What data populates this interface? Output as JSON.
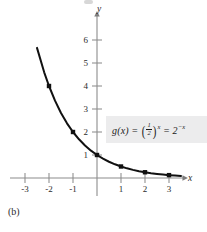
{
  "figure": {
    "caption": "(b)",
    "background_color": "#ffffff",
    "curve_color": "#111111",
    "axis_color": "#8c8c8c",
    "formula_box_color": "#ececed"
  },
  "axes": {
    "x_label": "x",
    "y_label": "y",
    "x_ticks": [
      "-3",
      "-2",
      "-1",
      "1",
      "2",
      "3"
    ],
    "x_tick_values": [
      -3,
      -2,
      -1,
      1,
      2,
      3
    ],
    "y_ticks": [
      "1",
      "2",
      "3",
      "4",
      "5",
      "6"
    ],
    "y_tick_values": [
      1,
      2,
      3,
      4,
      5,
      6
    ],
    "origin_label": ""
  },
  "formula": {
    "function_name": "g(x)",
    "equals_1": "=",
    "base_numerator": "1",
    "base_denominator": "2",
    "exponent_1": "x",
    "equals_2": "=",
    "base_2": "2",
    "exponent_2": "−x",
    "plain_text": "g(x) = (1/2)^x = 2^(-x)"
  },
  "chart_data": {
    "type": "line",
    "title": "",
    "subtitle": "",
    "xlabel": "x",
    "ylabel": "y",
    "xlim": [
      -3.6,
      3.9
    ],
    "ylim": [
      -0.35,
      7.0
    ],
    "grid": false,
    "legend": null,
    "annotations": [
      {
        "text": "g(x) = (1/2)^x = 2^(-x)",
        "x": 1.1,
        "y": 2.0
      }
    ],
    "series": [
      {
        "name": "g(x) = (1/2)^x = 2^-x",
        "x": [
          -3.1,
          -2.8,
          -2.5,
          -2.2,
          -2.0,
          -1.75,
          -1.5,
          -1.25,
          -1.0,
          -0.75,
          -0.5,
          -0.25,
          0.0,
          0.25,
          0.5,
          0.75,
          1.0,
          1.25,
          1.5,
          1.75,
          2.0,
          2.25,
          2.5,
          2.75,
          3.0,
          3.25,
          3.5
        ],
        "y": [
          8.574,
          6.964,
          5.657,
          4.595,
          4.0,
          3.364,
          2.828,
          2.378,
          2.0,
          1.682,
          1.414,
          1.189,
          1.0,
          0.841,
          0.707,
          0.595,
          0.5,
          0.42,
          0.354,
          0.297,
          0.25,
          0.21,
          0.177,
          0.149,
          0.125,
          0.105,
          0.088
        ],
        "marked_points": [
          {
            "x": -2,
            "y": 4
          },
          {
            "x": -1,
            "y": 2
          },
          {
            "x": 0,
            "y": 1
          },
          {
            "x": 1,
            "y": 0.5
          },
          {
            "x": 2,
            "y": 0.25
          },
          {
            "x": 3,
            "y": 0.125
          }
        ]
      }
    ]
  }
}
